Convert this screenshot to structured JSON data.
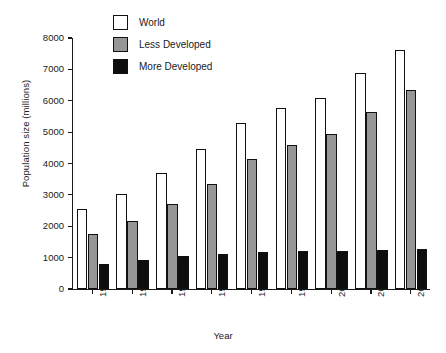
{
  "chart_data": {
    "type": "bar",
    "title": "",
    "xlabel": "Year",
    "ylabel": "Population size (millions)",
    "categories": [
      "1950",
      "1960",
      "1970",
      "1980",
      "1990",
      "1996",
      "2000",
      "2010",
      "2020"
    ],
    "ylim": [
      0,
      8000
    ],
    "yticks": [
      0,
      1000,
      2000,
      3000,
      4000,
      5000,
      6000,
      7000,
      8000
    ],
    "ytick_labels": [
      "0",
      "1000",
      "2000",
      "3000",
      "4000",
      "5000",
      "6000",
      "7000",
      "8000"
    ],
    "grid": false,
    "legend_position": "top-center",
    "series": [
      {
        "name": "World",
        "color": "#ffffff",
        "values": [
          2550,
          3020,
          3700,
          4450,
          5280,
          5770,
          6100,
          6900,
          7620
        ]
      },
      {
        "name": "Less Developed",
        "color": "#969696",
        "values": [
          1750,
          2180,
          2700,
          3350,
          4150,
          4600,
          4930,
          5650,
          6350
        ]
      },
      {
        "name": "More Developed",
        "color": "#0d0d0d",
        "values": [
          810,
          930,
          1050,
          1130,
          1170,
          1200,
          1210,
          1250,
          1270
        ]
      }
    ]
  },
  "legend": {
    "items": [
      {
        "label": "World",
        "swatch": "world"
      },
      {
        "label": "Less Developed",
        "swatch": "less"
      },
      {
        "label": "More Developed",
        "swatch": "more"
      }
    ]
  }
}
